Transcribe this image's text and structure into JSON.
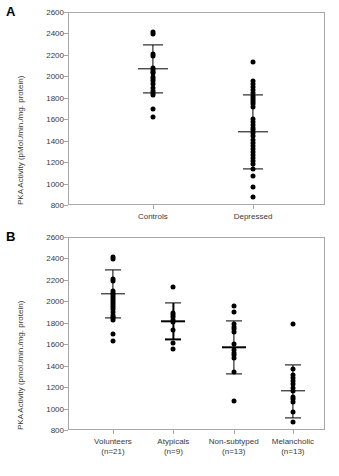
{
  "figure": {
    "panel_a_letter": "A",
    "panel_b_letter": "B"
  },
  "chart_data": [
    {
      "type": "scatter",
      "panel": "A",
      "title": "",
      "xlabel": "",
      "ylabel": "PKA Activity (pMol./min./mg. protein)",
      "ylim": [
        800,
        2600
      ],
      "yticks": [
        800,
        1000,
        1200,
        1400,
        1600,
        1800,
        2000,
        2200,
        2400,
        2600
      ],
      "grid": false,
      "legend": "none",
      "categories": [
        "Controls",
        "Depressed"
      ],
      "series": [
        {
          "name": "Controls",
          "values": [
            2410,
            2395,
            2210,
            2190,
            2075,
            2060,
            2045,
            2030,
            1995,
            1975,
            1960,
            1930,
            1890,
            1860,
            1840,
            1825,
            1700,
            1625
          ],
          "mean": 2070,
          "sd_upper": 2290,
          "sd_lower": 1845
        },
        {
          "name": "Depressed",
          "values": [
            2130,
            1955,
            1930,
            1900,
            1870,
            1845,
            1820,
            1800,
            1780,
            1760,
            1740,
            1715,
            1600,
            1570,
            1545,
            1520,
            1500,
            1470,
            1440,
            1410,
            1380,
            1350,
            1320,
            1290,
            1265,
            1240,
            1210,
            1180,
            1140,
            1075,
            970,
            875
          ],
          "mean": 1480,
          "sd_upper": 1825,
          "sd_lower": 1135
        }
      ]
    },
    {
      "type": "scatter",
      "panel": "B",
      "title": "",
      "xlabel": "",
      "ylabel": "PKA Activity (pmol./min./mg. protein)",
      "ylim": [
        800,
        2600
      ],
      "yticks": [
        800,
        1000,
        1200,
        1400,
        1600,
        1800,
        2000,
        2200,
        2400,
        2600
      ],
      "grid": false,
      "legend": "none",
      "categories": [
        "Volunteers",
        "Atypicals",
        "Non-subtyped",
        "Melancholic"
      ],
      "category_counts": [
        "(n=21)",
        "(n=9)",
        "(n=13)",
        "(n=13)"
      ],
      "series": [
        {
          "name": "Volunteers",
          "values": [
            2410,
            2395,
            2210,
            2190,
            2100,
            2075,
            2060,
            2040,
            2020,
            2000,
            1985,
            1965,
            1945,
            1925,
            1900,
            1875,
            1855,
            1840,
            1825,
            1700,
            1630
          ],
          "mean": 2070,
          "sd_upper": 2295,
          "sd_lower": 1845
        },
        {
          "name": "Atypicals",
          "values": [
            2135,
            1895,
            1870,
            1850,
            1830,
            1810,
            1735,
            1610,
            1560
          ],
          "mean": 1815,
          "sd_upper": 1985,
          "sd_lower": 1645
        },
        {
          "name": "Non-subtyped",
          "values": [
            1955,
            1900,
            1785,
            1760,
            1740,
            1715,
            1600,
            1545,
            1520,
            1495,
            1470,
            1340,
            1075
          ],
          "mean": 1570,
          "sd_upper": 1815,
          "sd_lower": 1325
        },
        {
          "name": "Melancholic",
          "values": [
            1785,
            1370,
            1310,
            1285,
            1255,
            1225,
            1195,
            1165,
            1110,
            1085,
            1060,
            970,
            875
          ],
          "mean": 1165,
          "sd_upper": 1410,
          "sd_lower": 915
        }
      ]
    }
  ]
}
